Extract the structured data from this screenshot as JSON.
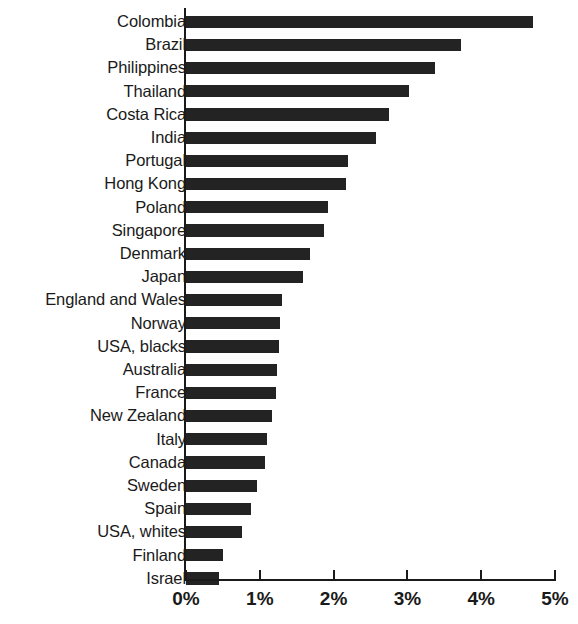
{
  "chart_data": {
    "type": "bar",
    "orientation": "horizontal",
    "title": "",
    "subtitle": "",
    "xlabel": "",
    "ylabel": "",
    "xlim": [
      0,
      5
    ],
    "grid": false,
    "legend": null,
    "bar_color": "#232323",
    "axis_color": "#1a1a1a",
    "value_unit": "%",
    "tick_labels": [
      "0%",
      "1%",
      "2%",
      "3%",
      "4%",
      "5%"
    ],
    "tick_values": [
      0,
      1,
      2,
      3,
      4,
      5
    ],
    "categories": [
      "Colombia",
      "Brazil",
      "Philippines",
      "Thailand",
      "Costa Rica",
      "India",
      "Portugal",
      "Hong Kong",
      "Poland",
      "Singapore",
      "Denmark",
      "Japan",
      "England and Wales",
      "Norway",
      "USA, blacks",
      "Australia",
      "France",
      "New Zealand",
      "Italy",
      "Canada",
      "Sweden",
      "Spain",
      "USA, whites",
      "Finland",
      "Israel"
    ],
    "values": [
      4.7,
      3.72,
      3.37,
      3.02,
      2.75,
      2.57,
      2.2,
      2.17,
      1.92,
      1.87,
      1.68,
      1.58,
      1.3,
      1.27,
      1.26,
      1.23,
      1.22,
      1.17,
      1.1,
      1.07,
      0.96,
      0.88,
      0.76,
      0.5,
      0.45
    ]
  }
}
